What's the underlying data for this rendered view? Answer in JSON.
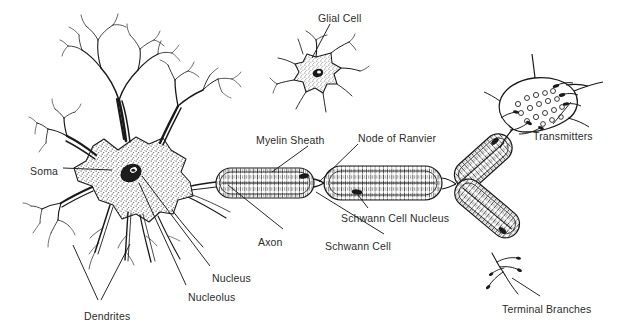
{
  "figure": {
    "background_color": "#ffffff",
    "ink_color": "#1a1a1a",
    "text_color": "#2b2b2b"
  },
  "labels": {
    "soma": "Soma",
    "dendrites": "Dendrites",
    "nucleolus": "Nucleolus",
    "nucleus": "Nucleus",
    "axon": "Axon",
    "glial_cell": "Glial Cell",
    "myelin_sheath": "Myelin Sheath",
    "node_of_ranvier": "Node of Ranvier",
    "schwann_cell": "Schwann Cell",
    "schwann_cell_nucleus": "Schwann Cell Nucleus",
    "transmitters": "Transmitters",
    "terminal_branches": "Terminal Branches"
  },
  "parts": [
    {
      "id": "soma",
      "name": "soma",
      "label": "Soma",
      "label_x": 30,
      "label_y": 165
    },
    {
      "id": "dendrites",
      "name": "dendrites",
      "label": "Dendrites",
      "label_x": 84,
      "label_y": 310
    },
    {
      "id": "nucleolus",
      "name": "nucleolus",
      "label": "Nucleolus",
      "label_x": 188,
      "label_y": 291
    },
    {
      "id": "nucleus",
      "name": "nucleus",
      "label": "Nucleus",
      "label_x": 212,
      "label_y": 272
    },
    {
      "id": "axon",
      "name": "axon",
      "label": "Axon",
      "label_x": 258,
      "label_y": 236
    },
    {
      "id": "glial-cell",
      "name": "glial-cell",
      "label": "Glial Cell",
      "label_x": 318,
      "label_y": 12
    },
    {
      "id": "myelin-sheath",
      "name": "myelin-sheath",
      "label": "Myelin Sheath",
      "label_x": 256,
      "label_y": 134
    },
    {
      "id": "node-of-ranvier",
      "name": "node-of-ranvier",
      "label": "Node of Ranvier",
      "label_x": 358,
      "label_y": 132
    },
    {
      "id": "schwann-cell",
      "name": "schwann-cell",
      "label": "Schwann Cell",
      "label_x": 325,
      "label_y": 240
    },
    {
      "id": "schwann-cell-nucleus",
      "name": "schwann-cell-nucleus",
      "label": "Schwann Cell Nucleus",
      "label_x": 341,
      "label_y": 212
    },
    {
      "id": "transmitters",
      "name": "transmitters",
      "label": "Transmitters",
      "label_x": 533,
      "label_y": 130
    },
    {
      "id": "terminal-branches",
      "name": "terminal-branches",
      "label": "Terminal Branches",
      "label_x": 502,
      "label_y": 303
    }
  ]
}
